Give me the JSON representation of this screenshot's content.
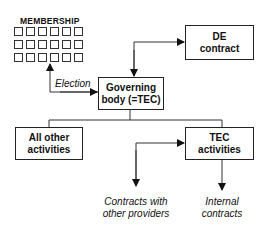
{
  "membership": {
    "title": "MEMBERSHIP",
    "grid_rows": 3,
    "grid_cols": 6
  },
  "edges": {
    "election_label": "Election"
  },
  "nodes": {
    "governing_body": {
      "line1": "Governing",
      "line2": "body (=TEC)"
    },
    "de_contract": {
      "line1": "DE",
      "line2": "contract"
    },
    "all_other_activities": {
      "line1": "All other",
      "line2": "activities"
    },
    "tec_activities": {
      "line1": "TEC",
      "line2": "activities"
    }
  },
  "outputs": {
    "contracts_other": {
      "line1": "Contracts with",
      "line2": "other providers"
    },
    "internal_contracts": {
      "line1": "Internal",
      "line2": "contracts"
    }
  },
  "colors": {
    "line": "#222222",
    "background": "#ffffff"
  }
}
